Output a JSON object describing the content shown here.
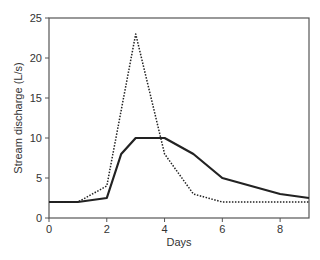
{
  "chart_data": {
    "type": "line",
    "title": "",
    "xlabel": "Days",
    "ylabel": "Stream discharge (L/s)",
    "xlim": [
      0,
      9
    ],
    "ylim": [
      0,
      25
    ],
    "x_ticks": [
      "0",
      "2",
      "4",
      "6",
      "8"
    ],
    "y_ticks": [
      "0",
      "5",
      "10",
      "15",
      "20",
      "25"
    ],
    "grid": false,
    "legend": null,
    "series": [
      {
        "name": "solid",
        "style": "solid",
        "x": [
          0,
          1,
          2,
          2.5,
          3,
          4,
          5,
          6,
          8,
          9
        ],
        "y": [
          2,
          2,
          2.5,
          8,
          10,
          10,
          8,
          5,
          3,
          2.5
        ]
      },
      {
        "name": "dotted",
        "style": "dotted",
        "x": [
          0,
          1,
          2,
          3,
          4,
          5,
          6,
          9
        ],
        "y": [
          2,
          2,
          4,
          23,
          8,
          3,
          2,
          2
        ]
      }
    ]
  }
}
